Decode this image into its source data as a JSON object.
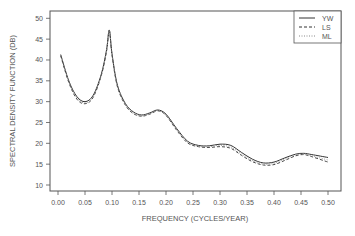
{
  "chart_data": {
    "type": "line",
    "title": "",
    "xlabel": "FREQUENCY (CYCLES/YEAR)",
    "ylabel": "SPECTRAL DENSITY FUNCTION (DB)",
    "xlim": [
      0.0,
      0.5
    ],
    "ylim": [
      10,
      50
    ],
    "xticks": [
      "0.00",
      "0.05",
      "0.10",
      "0.15",
      "0.20",
      "0.25",
      "0.30",
      "0.35",
      "0.40",
      "0.45",
      "0.50"
    ],
    "yticks": [
      "10",
      "15",
      "20",
      "25",
      "30",
      "35",
      "40",
      "45",
      "50"
    ],
    "grid": false,
    "legend_position": "top-right",
    "x": [
      0.005,
      0.02,
      0.035,
      0.05,
      0.065,
      0.08,
      0.09,
      0.095,
      0.1,
      0.11,
      0.125,
      0.14,
      0.155,
      0.17,
      0.185,
      0.2,
      0.22,
      0.24,
      0.26,
      0.28,
      0.3,
      0.32,
      0.34,
      0.36,
      0.38,
      0.4,
      0.42,
      0.44,
      0.455,
      0.47,
      0.5
    ],
    "series": [
      {
        "name": "YW",
        "style": "solid",
        "values": [
          41.3,
          35.0,
          31.2,
          30.0,
          31.5,
          36.5,
          42.5,
          47.2,
          41.5,
          34.0,
          29.5,
          27.5,
          26.8,
          27.3,
          28.0,
          27.0,
          23.5,
          20.5,
          19.5,
          19.4,
          19.8,
          19.5,
          17.8,
          16.2,
          15.3,
          15.5,
          16.5,
          17.4,
          17.6,
          17.3,
          16.6
        ]
      },
      {
        "name": "LS",
        "style": "dashed",
        "values": [
          41.0,
          34.6,
          30.6,
          29.5,
          31.0,
          36.2,
          42.2,
          47.0,
          41.2,
          33.6,
          29.1,
          27.1,
          26.5,
          27.0,
          27.8,
          26.7,
          23.1,
          20.1,
          19.2,
          19.0,
          19.2,
          18.8,
          17.1,
          15.6,
          14.8,
          14.9,
          15.9,
          17.0,
          17.3,
          16.8,
          15.5
        ]
      },
      {
        "name": "ML",
        "style": "dotted",
        "values": [
          41.1,
          34.8,
          30.9,
          29.7,
          31.2,
          36.3,
          42.3,
          47.1,
          41.3,
          33.8,
          29.3,
          27.3,
          26.6,
          27.1,
          27.9,
          26.8,
          23.3,
          20.3,
          19.3,
          19.2,
          19.5,
          19.1,
          17.4,
          15.9,
          15.0,
          15.2,
          16.2,
          17.2,
          17.4,
          17.0,
          16.0
        ]
      }
    ]
  },
  "legend": {
    "items": [
      {
        "label": "YW"
      },
      {
        "label": "LS"
      },
      {
        "label": "ML"
      }
    ]
  }
}
